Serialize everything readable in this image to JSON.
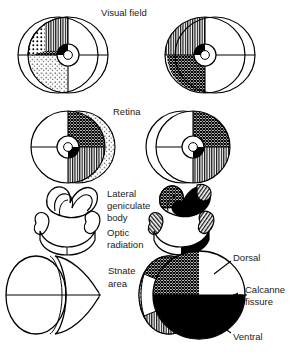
{
  "figure": {
    "title_row_labels": {
      "visual_field": "Visual field",
      "retina": "Retina",
      "lateral_geniculate_body_l1": "Lateral",
      "lateral_geniculate_body_l2": "geniculate",
      "lateral_geniculate_body_l3": "body",
      "optic_radiation_l1": "Optic",
      "optic_radiation_l2": "radiation",
      "striate_area_l1": "Stnate",
      "striate_area_l2": "area"
    },
    "annotations": {
      "dorsal": "Dorsal",
      "calcarine_fissure_l1": "Calcanne",
      "calcarine_fissure_l2": "fissure",
      "ventral": "Ventral"
    },
    "colors": {
      "ink": "#000000",
      "background": "#ffffff",
      "text": "#222222"
    },
    "patterns": {
      "solid_black": "solid-black",
      "cross_hatch": "cross-hatch",
      "vertical_hatch": "vertical-hatch",
      "diagonal_hatch": "diagonal-hatch",
      "coarse_dots": "coarse-dots",
      "fine_stipple": "fine-stipple",
      "white": "white"
    },
    "rows": [
      {
        "name": "visual-field",
        "left_eye": {
          "quadrants": [
            "coarse-dots",
            "vertical-hatch",
            "white",
            "white"
          ],
          "crescent_upper": "coarse-dots",
          "crescent_lower": "fine-stipple",
          "lower_inner": "cross-hatch",
          "fovea": "split-black-white"
        },
        "right_eye": {
          "quadrants": [
            "vertical-hatch",
            "white",
            "white",
            "cross-hatch"
          ],
          "fovea": "split-black-white"
        }
      },
      {
        "name": "retina",
        "left_eye": {
          "upper_nasal": "cross-hatch",
          "lower_nasal": "vertical-hatch",
          "temporal": "white",
          "crescent": "coarse-dots",
          "fovea": "split-black-white"
        },
        "right_eye": {
          "upper_nasal": "cross-hatch",
          "lower_nasal": "vertical-hatch",
          "temporal": "white",
          "fovea": "split-black-white"
        }
      },
      {
        "name": "lateral-geniculate-body",
        "left": {
          "fill": "white"
        },
        "right": {
          "fill_upper": "cross-hatch",
          "fill_lower": "solid-black",
          "cap": "diagonal-hatch"
        }
      },
      {
        "name": "optic-radiation",
        "left": {
          "fill": "white"
        },
        "right": {
          "fill": "solid-black",
          "cap": "diagonal-hatch"
        }
      },
      {
        "name": "striate-area",
        "left": {
          "fill": "white"
        },
        "right": {
          "upper_posterior": "cross-hatch",
          "upper_anterior": "white",
          "lower": "solid-black",
          "pole_upper": "cross-hatch",
          "pole_lower": "vertical-hatch",
          "pole_tip": "coarse-dots"
        }
      }
    ]
  }
}
